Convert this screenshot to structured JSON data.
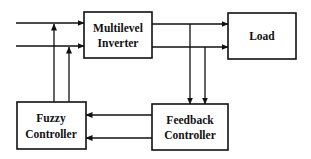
{
  "diagram": {
    "type": "block-diagram",
    "colors": {
      "stroke": "#111111",
      "background": "#ffffff"
    },
    "blocks": [
      {
        "id": "inverter",
        "lines": [
          "Multilevel",
          "Inverter"
        ]
      },
      {
        "id": "load",
        "lines": [
          "Load"
        ]
      },
      {
        "id": "fuzzy",
        "lines": [
          "Fuzzy",
          "Controller"
        ]
      },
      {
        "id": "feedback",
        "lines": [
          "Feedback",
          "Controller"
        ]
      }
    ],
    "connections": [
      {
        "from": "external-input-1",
        "to": "inverter"
      },
      {
        "from": "external-input-2",
        "to": "inverter"
      },
      {
        "from": "fuzzy",
        "to": "inverter-input-1",
        "type": "junction"
      },
      {
        "from": "fuzzy",
        "to": "inverter-input-2",
        "type": "junction"
      },
      {
        "from": "inverter",
        "to": "load",
        "count": 2
      },
      {
        "from": "inverter-output",
        "to": "feedback",
        "count": 2
      },
      {
        "from": "feedback",
        "to": "fuzzy",
        "count": 2
      }
    ]
  }
}
